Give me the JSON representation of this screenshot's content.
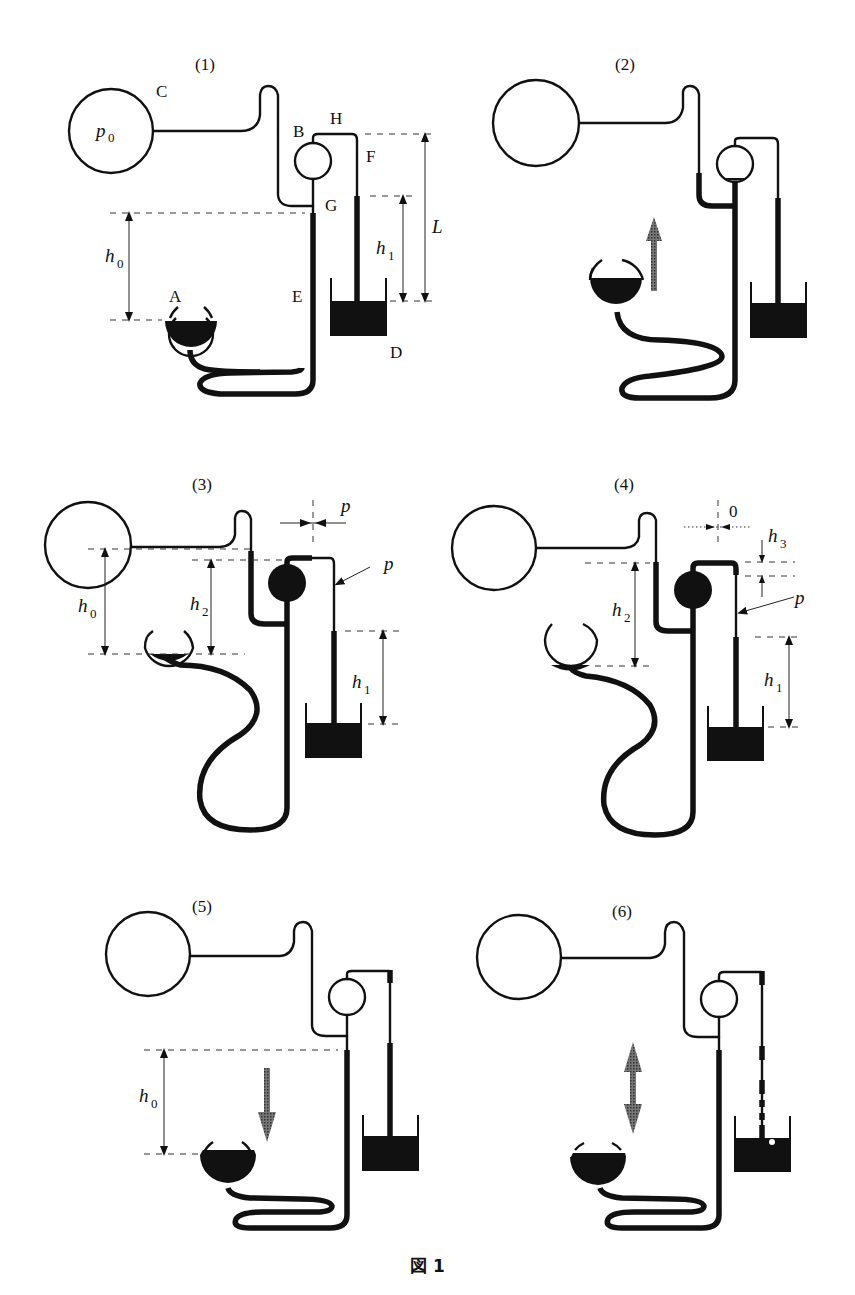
{
  "figure": {
    "caption": "図 1",
    "header_fragment": "..."
  },
  "panels": [
    {
      "id": "1",
      "title": "(1)",
      "labels": {
        "C": "C",
        "p0": "p",
        "p0_sub": "0",
        "A": "A",
        "B": "B",
        "D": "D",
        "E": "E",
        "F": "F",
        "G": "G",
        "H": "H",
        "h0": "h",
        "h0_sub": "0",
        "h1": "h",
        "h1_sub": "1",
        "L": "L"
      },
      "state": {
        "bulb_filled": false,
        "reservoir_fill": "high",
        "arrow": "none"
      }
    },
    {
      "id": "2",
      "title": "(2)",
      "labels": {},
      "state": {
        "bulb_filled": false,
        "reservoir_fill": "high",
        "arrow": "up"
      }
    },
    {
      "id": "3",
      "title": "(3)",
      "labels": {
        "h0": "h",
        "h0_sub": "0",
        "h2": "h",
        "h2_sub": "2",
        "h1": "h",
        "h1_sub": "1",
        "p_top": "p",
        "p_side": "p"
      },
      "state": {
        "bulb_filled": true,
        "reservoir_fill": "low",
        "arrow": "none"
      }
    },
    {
      "id": "4",
      "title": "(4)",
      "labels": {
        "zero": "0",
        "h3": "h",
        "h3_sub": "3",
        "h2": "h",
        "h2_sub": "2",
        "h1": "h",
        "h1_sub": "1",
        "p_side": "p"
      },
      "state": {
        "bulb_filled": true,
        "reservoir_fill": "low",
        "arrow": "none"
      }
    },
    {
      "id": "5",
      "title": "(5)",
      "labels": {
        "h0": "h",
        "h0_sub": "0"
      },
      "state": {
        "bulb_filled": false,
        "reservoir_fill": "high",
        "arrow": "down"
      }
    },
    {
      "id": "6",
      "title": "(6)",
      "labels": {},
      "state": {
        "bulb_filled": false,
        "reservoir_fill": "high",
        "arrow": "up-down"
      }
    }
  ],
  "colors": {
    "ink": "#111111",
    "arrow_fill": "#555555",
    "background": "#ffffff"
  }
}
